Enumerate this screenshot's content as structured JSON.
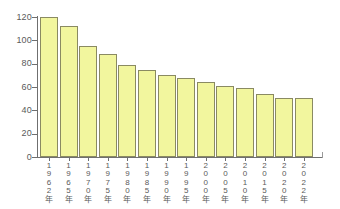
{
  "chart_data": {
    "type": "bar",
    "title": "",
    "subtitle": "",
    "xlabel": "",
    "ylabel": "",
    "categories": [
      "1962年",
      "1965年",
      "1970年",
      "1975年",
      "1980年",
      "1985年",
      "1990年",
      "1995年",
      "2000年",
      "2005年",
      "2010年",
      "2015年",
      "2020年",
      "2022年"
    ],
    "values": [
      120,
      112,
      95,
      88,
      79,
      75,
      70,
      68,
      64,
      61,
      59,
      54,
      51,
      51
    ],
    "ylim": [
      0,
      120
    ],
    "ytick_labels": [
      "0",
      "20",
      "40",
      "60",
      "80",
      "100",
      "120"
    ],
    "ytick_values": [
      0,
      20,
      40,
      60,
      80,
      100,
      120
    ],
    "grid": false,
    "legend": null,
    "legend_position": "none",
    "annotations": [],
    "colors": {
      "bar_fill": "#f2f69e",
      "bar_border": "#8a8a62",
      "axis": "#6f6f6f",
      "tick_label": "#5a5a5a",
      "background": "#ffffff"
    }
  }
}
